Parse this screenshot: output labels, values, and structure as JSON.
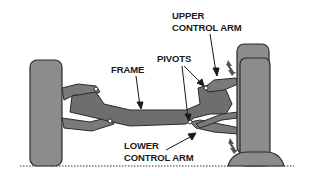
{
  "diagram": {
    "labels": {
      "upper_control_arm_line1": "UPPER",
      "upper_control_arm_line2": "CONTROL ARM",
      "pivots": "PIVOTS",
      "frame": "FRAME",
      "lower_control_arm_line1": "LOWER",
      "lower_control_arm_line2": "CONTROL ARM"
    },
    "colors": {
      "tire_fill": "#8c8c8c",
      "frame_fill": "#6e6e6e",
      "arm_fill": "#7a7a7a",
      "outline": "#2a2a2a",
      "label_text": "#1a1a1a",
      "background": "#ffffff"
    }
  }
}
